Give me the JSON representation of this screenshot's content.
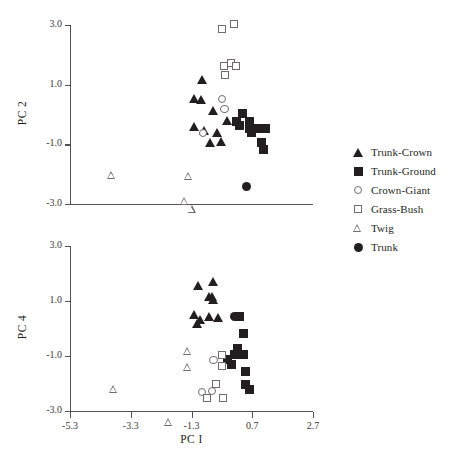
{
  "chart_data": [
    {
      "type": "scatter",
      "panel_id": "top",
      "title": "",
      "xlabel": "PC I",
      "ylabel": "PC 2",
      "xlim": [
        -5.3,
        2.7
      ],
      "ylim": [
        -3.0,
        3.0
      ],
      "xticks": [
        "-5.3",
        "-3.3",
        "-1.3",
        "0.7",
        "2.7"
      ],
      "xtick_values": [
        -5.3,
        -3.3,
        -1.3,
        0.7,
        2.7
      ],
      "yticks": [
        "3.0",
        "1.0",
        "-1.0",
        "-3.0"
      ],
      "ytick_values": [
        3.0,
        1.0,
        -1.0,
        -3.0
      ],
      "grid": false,
      "legend_position": "right",
      "series": [
        {
          "name": "Trunk-Crown",
          "marker": "filled-triangle",
          "color": "#231f20",
          "points": [
            [
              -0.95,
              1.18
            ],
            [
              -1.22,
              0.52
            ],
            [
              -1.0,
              0.5
            ],
            [
              -0.58,
              0.12
            ],
            [
              -1.22,
              -0.4
            ],
            [
              -0.88,
              -0.55
            ],
            [
              -0.47,
              -0.62
            ],
            [
              -0.7,
              -0.93
            ],
            [
              -0.33,
              -0.9
            ],
            [
              -0.12,
              -0.2
            ]
          ]
        },
        {
          "name": "Trunk-Ground",
          "marker": "filled-square",
          "color": "#231f20",
          "points": [
            [
              0.38,
              0.05
            ],
            [
              0.18,
              -0.22
            ],
            [
              0.28,
              -0.38
            ],
            [
              0.6,
              -0.25
            ],
            [
              0.62,
              -0.48
            ],
            [
              0.88,
              -0.48
            ],
            [
              1.12,
              -0.48
            ],
            [
              1.02,
              -0.95
            ],
            [
              1.06,
              -1.18
            ],
            [
              0.66,
              -0.6
            ]
          ]
        },
        {
          "name": "Crown-Giant",
          "marker": "open-circle",
          "color": "#6f6b6a",
          "points": [
            [
              -0.3,
              0.52
            ],
            [
              -0.22,
              0.18
            ],
            [
              -0.92,
              -0.62
            ]
          ]
        },
        {
          "name": "Grass-Bush",
          "marker": "open-square",
          "color": "#6f6b6a",
          "points": [
            [
              -0.3,
              2.88
            ],
            [
              0.1,
              3.05
            ],
            [
              -0.22,
              1.62
            ],
            [
              0.0,
              1.72
            ],
            [
              0.18,
              1.62
            ],
            [
              -0.2,
              1.32
            ]
          ]
        },
        {
          "name": "Twig",
          "marker": "open-triangle",
          "color": "#6f6b6a",
          "points": [
            [
              -3.92,
              -2.02
            ],
            [
              -1.4,
              -1.8
            ],
            [
              -1.52,
              -2.35
            ],
            [
              -1.28,
              -2.38
            ]
          ]
        },
        {
          "name": "Trunk",
          "marker": "filled-circle",
          "color": "#231f20",
          "points": [
            [
              0.52,
              -2.4
            ]
          ]
        }
      ]
    },
    {
      "type": "scatter",
      "panel_id": "bottom",
      "title": "",
      "xlabel": "PC I",
      "ylabel": "PC 4",
      "xlim": [
        -5.3,
        2.7
      ],
      "ylim": [
        -3.0,
        3.0
      ],
      "xticks": [
        "-5.3",
        "-3.3",
        "-1.3",
        "0.7",
        "2.7"
      ],
      "xtick_values": [
        -5.3,
        -3.3,
        -1.3,
        0.7,
        2.7
      ],
      "yticks": [
        "3.0",
        "1.0",
        "-1.0",
        "-3.0"
      ],
      "ytick_values": [
        3.0,
        1.0,
        -1.0,
        -3.0
      ],
      "grid": false,
      "legend_position": "right",
      "series": [
        {
          "name": "Trunk-Crown",
          "marker": "filled-triangle",
          "color": "#231f20",
          "points": [
            [
              -1.08,
              1.55
            ],
            [
              -0.6,
              1.72
            ],
            [
              -0.72,
              1.18
            ],
            [
              -0.62,
              1.18
            ],
            [
              -0.58,
              1.05
            ],
            [
              -1.2,
              0.52
            ],
            [
              -1.02,
              0.32
            ],
            [
              -1.12,
              0.18
            ],
            [
              -0.72,
              0.45
            ],
            [
              -0.42,
              0.4
            ]
          ]
        },
        {
          "name": "Trunk-Ground",
          "marker": "filled-square",
          "color": "#231f20",
          "points": [
            [
              0.28,
              0.42
            ],
            [
              0.42,
              -0.18
            ],
            [
              0.2,
              -0.72
            ],
            [
              0.12,
              -0.95
            ],
            [
              0.4,
              -0.95
            ],
            [
              0.48,
              -1.55
            ],
            [
              0.48,
              -2.05
            ],
            [
              0.62,
              -2.22
            ],
            [
              -0.12,
              -1.12
            ],
            [
              0.02,
              -1.3
            ]
          ]
        },
        {
          "name": "Crown-Giant",
          "marker": "open-circle",
          "color": "#6f6b6a",
          "points": [
            [
              -0.58,
              -1.15
            ],
            [
              -0.95,
              -2.3
            ],
            [
              -0.62,
              -2.28
            ]
          ]
        },
        {
          "name": "Grass-Bush",
          "marker": "open-square",
          "color": "#6f6b6a",
          "points": [
            [
              -0.28,
              -0.95
            ],
            [
              -0.3,
              -1.35
            ],
            [
              -0.48,
              -2.0
            ],
            [
              -0.78,
              -2.52
            ],
            [
              -0.25,
              -2.52
            ]
          ]
        },
        {
          "name": "Twig",
          "marker": "open-triangle",
          "color": "#6f6b6a",
          "points": [
            [
              -1.42,
              -0.82
            ],
            [
              -1.42,
              -1.12
            ],
            [
              -3.85,
              -1.62
            ],
            [
              -2.05,
              -2.52
            ]
          ]
        },
        {
          "name": "Trunk",
          "marker": "filled-circle",
          "color": "#231f20",
          "points": [
            [
              0.12,
              0.42
            ]
          ]
        }
      ]
    }
  ],
  "legend": {
    "items": [
      {
        "label": "Trunk-Crown",
        "marker": "filled-triangle"
      },
      {
        "label": "Trunk-Ground",
        "marker": "filled-square"
      },
      {
        "label": "Crown-Giant",
        "marker": "open-circle"
      },
      {
        "label": "Grass-Bush",
        "marker": "open-square"
      },
      {
        "label": "Twig",
        "marker": "open-triangle"
      },
      {
        "label": "Trunk",
        "marker": "filled-circle"
      }
    ]
  }
}
